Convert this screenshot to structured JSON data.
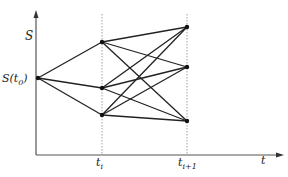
{
  "diagram": {
    "type": "trinomial-tree",
    "y_axis_label": "S",
    "x_axis_label": "t",
    "origin_label": "S(t",
    "origin_sub": "0",
    "origin_close": ")",
    "tick1_label": "t",
    "tick1_sub": "i",
    "tick2_label": "t",
    "tick2_sub": "i+1",
    "nodes": {
      "origin": {
        "x": 38,
        "y": 78
      },
      "ti": [
        {
          "x": 102,
          "y": 42
        },
        {
          "x": 102,
          "y": 88
        },
        {
          "x": 102,
          "y": 115
        }
      ],
      "ti1": [
        {
          "x": 187,
          "y": 27
        },
        {
          "x": 187,
          "y": 67
        },
        {
          "x": 187,
          "y": 121
        }
      ]
    },
    "line_color": "#222222"
  }
}
